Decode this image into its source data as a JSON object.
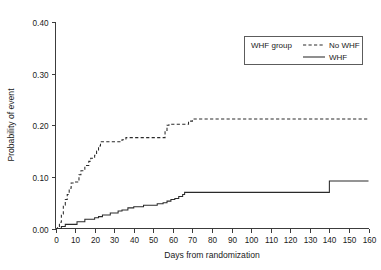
{
  "chart_data": {
    "type": "line",
    "subtype": "kaplan-meier-step",
    "title": "",
    "xlabel": "Days from randomization",
    "ylabel": "Probability of event",
    "xlim": [
      0,
      160
    ],
    "ylim": [
      0.0,
      0.4
    ],
    "xticks": [
      0,
      10,
      20,
      30,
      40,
      50,
      60,
      70,
      80,
      90,
      100,
      110,
      120,
      130,
      140,
      150,
      160
    ],
    "xtick_labels": [
      "0",
      "10",
      "20",
      "30",
      "40",
      "50",
      "60",
      "70",
      "80",
      "90",
      "100",
      "110",
      "120",
      "130",
      "140",
      "150",
      "160"
    ],
    "yticks": [
      0.0,
      0.1,
      0.2,
      0.3,
      0.4
    ],
    "ytick_labels": [
      "0.00",
      "0.10",
      "0.20",
      "0.30",
      "0.40"
    ],
    "grid": false,
    "legend_title": "WHF group",
    "legend_position": "top-right",
    "series": [
      {
        "name": "No WHF",
        "style": "dashed",
        "color": "#2a2a2a",
        "points": [
          [
            0,
            0.0
          ],
          [
            1,
            0.004
          ],
          [
            2,
            0.012
          ],
          [
            3,
            0.028
          ],
          [
            4,
            0.045
          ],
          [
            5,
            0.056
          ],
          [
            6,
            0.066
          ],
          [
            7,
            0.078
          ],
          [
            8,
            0.088
          ],
          [
            9,
            0.09
          ],
          [
            11,
            0.09
          ],
          [
            12,
            0.104
          ],
          [
            13,
            0.112
          ],
          [
            15,
            0.122
          ],
          [
            17,
            0.13
          ],
          [
            18,
            0.136
          ],
          [
            20,
            0.142
          ],
          [
            21,
            0.15
          ],
          [
            22,
            0.16
          ],
          [
            23,
            0.168
          ],
          [
            33,
            0.168
          ],
          [
            34,
            0.172
          ],
          [
            36,
            0.176
          ],
          [
            38,
            0.176
          ],
          [
            55,
            0.176
          ],
          [
            56,
            0.19
          ],
          [
            57,
            0.2
          ],
          [
            58,
            0.202
          ],
          [
            67,
            0.202
          ],
          [
            68,
            0.208
          ],
          [
            70,
            0.212
          ],
          [
            160,
            0.212
          ]
        ]
      },
      {
        "name": "WHF",
        "style": "solid",
        "color": "#2a2a2a",
        "points": [
          [
            0,
            0.0
          ],
          [
            2,
            0.0
          ],
          [
            3,
            0.004
          ],
          [
            5,
            0.008
          ],
          [
            7,
            0.008
          ],
          [
            10,
            0.008
          ],
          [
            11,
            0.013
          ],
          [
            14,
            0.013
          ],
          [
            15,
            0.018
          ],
          [
            19,
            0.018
          ],
          [
            20,
            0.021
          ],
          [
            22,
            0.023
          ],
          [
            24,
            0.026
          ],
          [
            26,
            0.026
          ],
          [
            28,
            0.03
          ],
          [
            30,
            0.03
          ],
          [
            32,
            0.034
          ],
          [
            34,
            0.036
          ],
          [
            37,
            0.04
          ],
          [
            40,
            0.042
          ],
          [
            43,
            0.042
          ],
          [
            45,
            0.045
          ],
          [
            48,
            0.045
          ],
          [
            52,
            0.048
          ],
          [
            55,
            0.05
          ],
          [
            57,
            0.053
          ],
          [
            59,
            0.056
          ],
          [
            61,
            0.058
          ],
          [
            63,
            0.062
          ],
          [
            65,
            0.066
          ],
          [
            66,
            0.07
          ],
          [
            139,
            0.07
          ],
          [
            140,
            0.092
          ],
          [
            160,
            0.092
          ]
        ]
      }
    ]
  },
  "legend": {
    "title": "WHF group",
    "entries": [
      {
        "label": "No WHF",
        "style": "dashed"
      },
      {
        "label": "WHF",
        "style": "solid"
      }
    ]
  },
  "axes": {
    "x_title": "Days from randomization",
    "y_title": "Probability of event"
  }
}
